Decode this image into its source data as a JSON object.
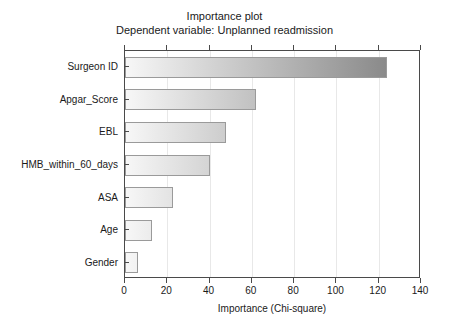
{
  "chart_data": {
    "type": "bar",
    "orientation": "horizontal",
    "title": "Importance plot",
    "subtitle": "Dependent variable: Unplanned readmission",
    "xlabel": "Importance (Chi-square)",
    "ylabel": "",
    "xlim": [
      0,
      140
    ],
    "ylim": null,
    "grid": true,
    "legend": null,
    "xticks": [
      0,
      20,
      40,
      60,
      80,
      100,
      120,
      140
    ],
    "xtick_labels": [
      "0",
      "20",
      "40",
      "60",
      "80",
      "100",
      "120",
      "140"
    ],
    "categories": [
      "Surgeon ID",
      "Apgar_Score",
      "EBL",
      "HMB_within_60_days",
      "ASA",
      "Age",
      "Gender"
    ],
    "values": [
      124,
      62,
      48,
      40,
      22.5,
      13,
      6
    ],
    "series": [
      {
        "name": "Importance (Chi-square)",
        "values": [
          124,
          62,
          48,
          40,
          22.5,
          13,
          6
        ]
      }
    ],
    "bar_gradient": {
      "start_color": "#f7f7f7",
      "end_color": "#8a8a8a",
      "border_color": "#9a9a9a"
    }
  },
  "figure": {
    "background_color": "#ffffff",
    "axis_color": "#4a4a4a",
    "gridline_color": "#e8e8e8",
    "text_color": "#1a1a1a"
  }
}
